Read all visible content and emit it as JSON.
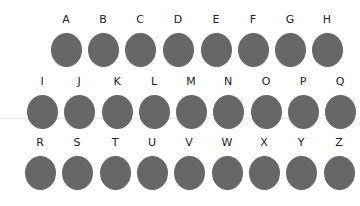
{
  "colors": {
    "circle": "#676767",
    "label": "#222222",
    "background": "#ffffff"
  },
  "rows": [
    {
      "top": 13,
      "items": [
        {
          "label": "A",
          "x": 66
        },
        {
          "label": "B",
          "x": 103
        },
        {
          "label": "C",
          "x": 140
        },
        {
          "label": "D",
          "x": 178
        },
        {
          "label": "E",
          "x": 216
        },
        {
          "label": "F",
          "x": 253
        },
        {
          "label": "G",
          "x": 290
        },
        {
          "label": "H",
          "x": 327
        }
      ]
    },
    {
      "top": 75,
      "items": [
        {
          "label": "I",
          "x": 42
        },
        {
          "label": "J",
          "x": 79
        },
        {
          "label": "K",
          "x": 117
        },
        {
          "label": "L",
          "x": 154
        },
        {
          "label": "M",
          "x": 191
        },
        {
          "label": "N",
          "x": 228
        },
        {
          "label": "O",
          "x": 266
        },
        {
          "label": "P",
          "x": 303
        },
        {
          "label": "Q",
          "x": 340
        }
      ]
    },
    {
      "top": 136,
      "items": [
        {
          "label": "R",
          "x": 40
        },
        {
          "label": "S",
          "x": 77
        },
        {
          "label": "T",
          "x": 115
        },
        {
          "label": "U",
          "x": 152
        },
        {
          "label": "V",
          "x": 189
        },
        {
          "label": "W",
          "x": 227
        },
        {
          "label": "X",
          "x": 264
        },
        {
          "label": "Y",
          "x": 301
        },
        {
          "label": "Z",
          "x": 339
        }
      ]
    }
  ]
}
